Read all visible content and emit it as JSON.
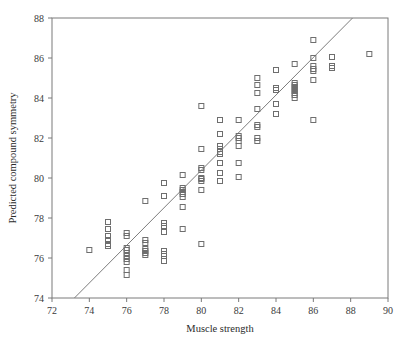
{
  "figure": {
    "background": "#ffffff",
    "frame_color": "#7a7a7a",
    "marker_color": "#6e6e6e",
    "line_color": "#7d7d7d"
  },
  "chart_data": {
    "type": "scatter",
    "title": "",
    "xlabel": "Muscle strength",
    "ylabel": "Predicted compound symmetry",
    "xlim": [
      72,
      90
    ],
    "ylim": [
      74,
      88
    ],
    "xticks": [
      72,
      74,
      76,
      78,
      80,
      82,
      84,
      86,
      88,
      90
    ],
    "yticks": [
      74,
      76,
      78,
      80,
      82,
      84,
      86,
      88
    ],
    "xtick_labels": [
      "72",
      "74",
      "76",
      "78",
      "80",
      "82",
      "84",
      "86",
      "88",
      "90"
    ],
    "ytick_labels": [
      "74",
      "76",
      "78",
      "80",
      "82",
      "84",
      "86",
      "88"
    ],
    "grid": false,
    "legend": null,
    "marker": "open-square",
    "marker_size": 5,
    "reference_line": {
      "label": "identity/fit line",
      "x": [
        73.2,
        88.1
      ],
      "y": [
        74.0,
        88.0
      ]
    },
    "points": [
      [
        74.0,
        76.4
      ],
      [
        75.0,
        77.8
      ],
      [
        75.0,
        77.45
      ],
      [
        75.0,
        77.1
      ],
      [
        75.0,
        76.9
      ],
      [
        75.0,
        76.7
      ],
      [
        75.0,
        76.6
      ],
      [
        76.0,
        77.25
      ],
      [
        76.0,
        77.1
      ],
      [
        76.0,
        76.5
      ],
      [
        76.0,
        76.4
      ],
      [
        76.0,
        76.25
      ],
      [
        76.0,
        76.1
      ],
      [
        76.0,
        75.95
      ],
      [
        76.0,
        75.8
      ],
      [
        76.0,
        75.4
      ],
      [
        76.0,
        75.15
      ],
      [
        77.0,
        78.85
      ],
      [
        77.0,
        76.9
      ],
      [
        77.0,
        76.75
      ],
      [
        77.0,
        76.45
      ],
      [
        77.0,
        76.35
      ],
      [
        77.0,
        76.25
      ],
      [
        77.0,
        76.15
      ],
      [
        78.0,
        79.75
      ],
      [
        78.0,
        79.1
      ],
      [
        78.0,
        77.75
      ],
      [
        78.0,
        77.6
      ],
      [
        78.0,
        77.3
      ],
      [
        78.0,
        76.35
      ],
      [
        78.0,
        76.2
      ],
      [
        78.0,
        76.1
      ],
      [
        78.0,
        75.85
      ],
      [
        79.0,
        80.15
      ],
      [
        79.0,
        79.5
      ],
      [
        79.0,
        79.4
      ],
      [
        79.0,
        79.3
      ],
      [
        79.0,
        79.2
      ],
      [
        79.0,
        79.05
      ],
      [
        79.0,
        78.55
      ],
      [
        79.0,
        77.45
      ],
      [
        80.0,
        83.6
      ],
      [
        80.0,
        81.45
      ],
      [
        80.0,
        80.5
      ],
      [
        80.0,
        80.4
      ],
      [
        80.0,
        80.0
      ],
      [
        80.0,
        79.95
      ],
      [
        80.0,
        79.85
      ],
      [
        80.0,
        79.4
      ],
      [
        80.0,
        76.7
      ],
      [
        81.0,
        82.9
      ],
      [
        81.0,
        82.2
      ],
      [
        81.0,
        81.6
      ],
      [
        81.0,
        81.45
      ],
      [
        81.0,
        81.3
      ],
      [
        81.0,
        81.2
      ],
      [
        81.0,
        80.75
      ],
      [
        81.0,
        80.25
      ],
      [
        81.0,
        79.85
      ],
      [
        82.0,
        82.9
      ],
      [
        82.0,
        82.1
      ],
      [
        82.0,
        82.0
      ],
      [
        82.0,
        81.85
      ],
      [
        82.0,
        81.6
      ],
      [
        82.0,
        80.75
      ],
      [
        82.0,
        80.05
      ],
      [
        83.0,
        85.0
      ],
      [
        83.0,
        84.65
      ],
      [
        83.0,
        84.25
      ],
      [
        83.0,
        83.45
      ],
      [
        83.0,
        82.65
      ],
      [
        83.0,
        82.55
      ],
      [
        83.0,
        82.0
      ],
      [
        83.0,
        81.85
      ],
      [
        84.0,
        85.4
      ],
      [
        84.0,
        84.5
      ],
      [
        84.0,
        84.4
      ],
      [
        84.0,
        83.7
      ],
      [
        84.0,
        83.2
      ],
      [
        85.0,
        85.7
      ],
      [
        85.0,
        84.75
      ],
      [
        85.0,
        84.65
      ],
      [
        85.0,
        84.55
      ],
      [
        85.0,
        84.45
      ],
      [
        85.0,
        84.35
      ],
      [
        85.0,
        84.25
      ],
      [
        85.0,
        84.15
      ],
      [
        85.0,
        84.0
      ],
      [
        86.0,
        86.9
      ],
      [
        86.0,
        86.0
      ],
      [
        86.0,
        85.6
      ],
      [
        86.0,
        85.45
      ],
      [
        86.0,
        85.35
      ],
      [
        86.0,
        84.9
      ],
      [
        86.0,
        82.9
      ],
      [
        87.0,
        86.05
      ],
      [
        87.0,
        85.6
      ],
      [
        87.0,
        85.5
      ],
      [
        89.0,
        86.2
      ]
    ]
  }
}
